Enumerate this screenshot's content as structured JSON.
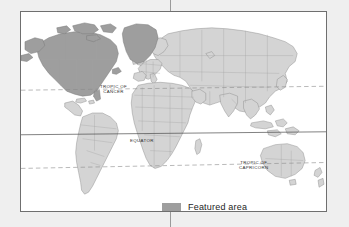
{
  "figure": {
    "type": "world-map",
    "projection": "equirectangular",
    "background_color": "#efefef",
    "map_background_color": "#ffffff",
    "frame_color": "#6f6f6f"
  },
  "colors": {
    "featured_land": "#9e9e9e",
    "other_land": "#d4d4d4",
    "land_outline": "#7a7a7a",
    "country_border": "#9d9d9d",
    "equator_line": "#4a4a4a",
    "tropic_line": "#8a8a8a",
    "label_text": "#2e2e2e",
    "legend_swatch": "#a9a9a9"
  },
  "latitude_lines": [
    {
      "id": "tropic-of-cancer",
      "label": "TROPIC OF\nCANCER",
      "style": "dashed",
      "latitude": 23.5
    },
    {
      "id": "equator",
      "label": "EQUATOR",
      "style": "solid",
      "latitude": 0
    },
    {
      "id": "tropic-of-capricorn",
      "label": "TROPIC OF\nCAPRICORN",
      "style": "dashed",
      "latitude": -23.5
    }
  ],
  "legend": {
    "swatch_color": "#9e9e9e",
    "label": "Featured area"
  },
  "featured_regions": [
    "United States",
    "Canada",
    "Greenland",
    "Alaska"
  ],
  "continents_shown": [
    "North America",
    "South America",
    "Europe",
    "Africa",
    "Asia",
    "Australia",
    "Greenland"
  ]
}
